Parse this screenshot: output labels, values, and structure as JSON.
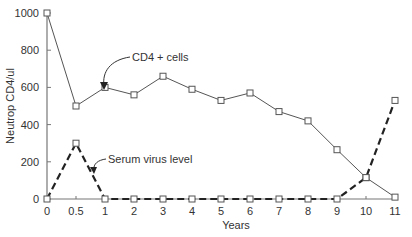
{
  "chart_data": {
    "type": "line",
    "title": "",
    "xlabel": "Years",
    "ylabel": "Neutrop CD4/ul",
    "categories": [
      "0",
      "0.5",
      "1",
      "2",
      "3",
      "4",
      "5",
      "6",
      "7",
      "8",
      "9",
      "10",
      "11"
    ],
    "yticks": [
      0,
      200,
      400,
      600,
      800,
      1000
    ],
    "ylim": [
      0,
      1000
    ],
    "grid": false,
    "legend": "none (inline annotations)",
    "series": [
      {
        "name": "CD4 + cells",
        "style": "solid",
        "values": [
          1000,
          500,
          600,
          560,
          660,
          590,
          530,
          570,
          470,
          420,
          265,
          115,
          10
        ]
      },
      {
        "name": "Serum virus level",
        "style": "dashed",
        "values": [
          0,
          300,
          0,
          0,
          0,
          0,
          0,
          0,
          0,
          0,
          0,
          115,
          530
        ]
      }
    ],
    "annotations": [
      {
        "text": "CD4 + cells",
        "points_to": "CD4 + cells series"
      },
      {
        "text": "Serum virus level",
        "points_to": "Serum virus level series"
      }
    ]
  }
}
